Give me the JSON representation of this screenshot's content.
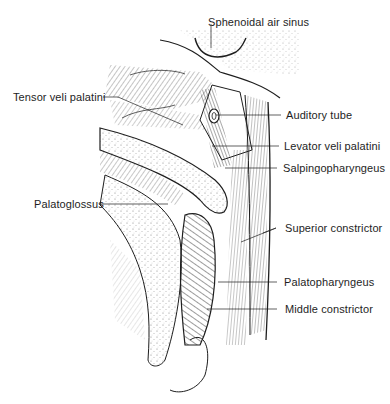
{
  "figure": {
    "colors": {
      "ink": "#1e1e1e",
      "background": "#ffffff",
      "hatch": "#3a3a3a",
      "stipple": "#6a6a6a"
    }
  },
  "labels": {
    "sphenoidal_air_sinus": "Sphenoidal air sinus",
    "tensor_veli_palatini": "Tensor veli palatini",
    "auditory_tube": "Auditory tube",
    "levator_veli_palatini": "Levator veli palatini",
    "salpingopharyngeus": "Salpingopharyngeus",
    "palatoglossus": "Palatoglossus",
    "superior_constrictor": "Superior constrictor",
    "palatopharyngeus": "Palatopharyngeus",
    "middle_constrictor": "Middle constrictor"
  }
}
